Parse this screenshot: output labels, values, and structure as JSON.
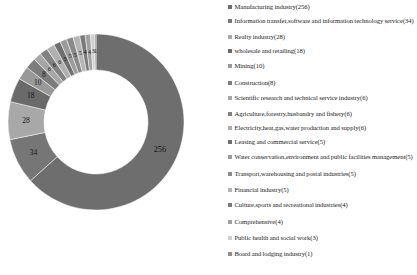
{
  "chart_data": {
    "type": "pie",
    "variant": "donut",
    "title": "",
    "subtitle": "",
    "xlabel": "",
    "ylabel": "",
    "legend_position": "right",
    "grid": false,
    "start_angle_deg": 0,
    "direction": "clockwise",
    "total": 404,
    "categories": [
      "Manufacturing industry",
      "Information transfer,software and information technology service",
      "Realty industry",
      "wholesale and retailing",
      "Mining",
      "Construction",
      "Scientific research and technical service industry",
      "Agriculture,forestry,husbandry and fishery",
      "Electricity,heat,gas,water production and supply",
      "Leasing and commercial service",
      "Water conservation,environment and public facilities management",
      "Transport,warehousing and postal industries",
      "Financial industry",
      "Culture,sports and recreational industries",
      "Comprehensive",
      "Public health and social work",
      "Board and lodging industry"
    ],
    "values": [
      256,
      34,
      28,
      18,
      10,
      8,
      6,
      6,
      6,
      5,
      5,
      5,
      5,
      4,
      4,
      3,
      1
    ],
    "colors": [
      "#6e6e6e",
      "#767676",
      "#a8a8a8",
      "#6a6a6a",
      "#999999",
      "#7c7c7c",
      "#a6a6a6",
      "#818181",
      "#b0b0b0",
      "#6f6f6f",
      "#9c9c9c",
      "#8a8a8a",
      "#b5b5b5",
      "#7a7a7a",
      "#a1a1a1",
      "#cfcfcf",
      "#8d8d8d"
    ],
    "slice_labels": [
      "256",
      "34",
      "28",
      "18",
      "10",
      "8",
      "6",
      "6",
      "6",
      "5",
      "5",
      "5",
      "5",
      "4",
      "4",
      "3",
      "1"
    ]
  },
  "legend": {
    "items": [
      {
        "label": "Manufacturing industry(256)",
        "color": "#6e6e6e",
        "value": 256
      },
      {
        "label": "Information transfer,software and information technology service(34)",
        "color": "#767676",
        "value": 34
      },
      {
        "label": "Realty industry(28)",
        "color": "#a8a8a8",
        "value": 28
      },
      {
        "label": "wholesale and retailing(18)",
        "color": "#6a6a6a",
        "value": 18
      },
      {
        "label": "Mining(10)",
        "color": "#999999",
        "value": 10
      },
      {
        "label": "Construction(8)",
        "color": "#7c7c7c",
        "value": 8
      },
      {
        "label": "Scientific research and technical service industry(6)",
        "color": "#a6a6a6",
        "value": 6
      },
      {
        "label": "Agriculture,forestry,husbandry and fishery(6)",
        "color": "#818181",
        "value": 6
      },
      {
        "label": "Electricity,heat,gas,water production and supply(6)",
        "color": "#b0b0b0",
        "value": 6
      },
      {
        "label": "Leasing and commercial service(5)",
        "color": "#6f6f6f",
        "value": 5
      },
      {
        "label": "Water conservation,environment and public facilities management(5)",
        "color": "#9c9c9c",
        "value": 5
      },
      {
        "label": "Transport,warehousing and postal industries(5)",
        "color": "#8a8a8a",
        "value": 5
      },
      {
        "label": "Financial industry(5)",
        "color": "#b5b5b5",
        "value": 5
      },
      {
        "label": "Culture,sports and recreational industries(4)",
        "color": "#7a7a7a",
        "value": 4
      },
      {
        "label": "Comprehensive(4)",
        "color": "#a1a1a1",
        "value": 4
      },
      {
        "label": "Public health and social work(3)",
        "color": "#cfcfcf",
        "value": 3
      },
      {
        "label": "Board and lodging industry(1)",
        "color": "#8d8d8d",
        "value": 1
      }
    ]
  },
  "geometry": {
    "cx": 96,
    "cy": 122,
    "outer_r": 88,
    "inner_r": 52,
    "label_r": 70
  }
}
